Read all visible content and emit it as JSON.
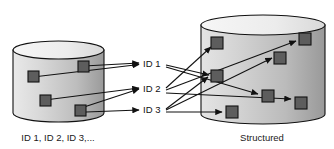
{
  "diagram": {
    "colors": {
      "outline": "#111111",
      "cylinder_fill_light": "#e6e6e6",
      "cylinder_fill_mid": "#cfcfcf",
      "cylinder_fill_dark": "#9d9d9d",
      "cylinder_top_fill": "#f2f2f2",
      "square_fill": "#5d5d5d",
      "square_border": "#111111",
      "arrow": "#111111",
      "text": "#111111",
      "background": "#ffffff"
    },
    "left_cylinder": {
      "label": "ID 1, ID 2, ID 3,...",
      "label_x": 58,
      "label_y": 140,
      "x": 13,
      "y": 41,
      "width": 91,
      "height": 81,
      "ellipse_ry": 9,
      "items": [
        {
          "name": "item-a",
          "x": 28,
          "y": 71,
          "size": 11
        },
        {
          "name": "item-b",
          "x": 78,
          "y": 61,
          "size": 11
        },
        {
          "name": "item-c",
          "x": 40,
          "y": 95,
          "size": 11
        },
        {
          "name": "item-d",
          "x": 75,
          "y": 105,
          "size": 11
        }
      ]
    },
    "right_cylinder": {
      "label": "Structured",
      "label_x": 262,
      "label_y": 140,
      "x": 201,
      "y": 15,
      "width": 124,
      "height": 109,
      "ellipse_ry": 10,
      "items": [
        {
          "name": "item-1",
          "x": 211,
          "y": 37,
          "size": 12
        },
        {
          "name": "item-2",
          "x": 299,
          "y": 33,
          "size": 12
        },
        {
          "name": "item-3",
          "x": 274,
          "y": 52,
          "size": 12
        },
        {
          "name": "item-4",
          "x": 211,
          "y": 70,
          "size": 12
        },
        {
          "name": "item-5",
          "x": 262,
          "y": 90,
          "size": 12
        },
        {
          "name": "item-6",
          "x": 295,
          "y": 97,
          "size": 12
        },
        {
          "name": "item-7",
          "x": 226,
          "y": 106,
          "size": 12
        }
      ]
    },
    "id_labels": [
      {
        "name": "id-1",
        "text": "ID 1",
        "x": 144,
        "y": 67
      },
      {
        "name": "id-2",
        "text": "ID 2",
        "x": 144,
        "y": 92
      },
      {
        "name": "id-3",
        "text": "ID 3",
        "x": 144,
        "y": 113
      }
    ],
    "arrows_in": [
      {
        "name": "arrow-item-b-to-id1",
        "x1": 84,
        "y1": 66,
        "x2": 140,
        "y2": 63
      },
      {
        "name": "arrow-item-a-to-id1",
        "x1": 33,
        "y1": 77,
        "x2": 140,
        "y2": 64
      },
      {
        "name": "arrow-item-d-to-id2",
        "x1": 81,
        "y1": 108,
        "x2": 140,
        "y2": 89
      },
      {
        "name": "arrow-item-c-to-id2",
        "x1": 45,
        "y1": 100,
        "x2": 140,
        "y2": 88
      },
      {
        "name": "arrow-item-d-to-id3",
        "x1": 86,
        "y1": 112,
        "x2": 140,
        "y2": 110
      }
    ],
    "arrows_out": [
      {
        "name": "arrow-id1-to-item4",
        "x1": 166,
        "y1": 66,
        "x2": 208,
        "y2": 76
      },
      {
        "name": "arrow-id1-to-item5",
        "x1": 166,
        "y1": 68,
        "x2": 258,
        "y2": 95
      },
      {
        "name": "arrow-id2-to-item1",
        "x1": 166,
        "y1": 88,
        "x2": 210,
        "y2": 47
      },
      {
        "name": "arrow-id2-to-item2",
        "x1": 166,
        "y1": 90,
        "x2": 296,
        "y2": 41
      },
      {
        "name": "arrow-id2-to-item6",
        "x1": 166,
        "y1": 93,
        "x2": 292,
        "y2": 99
      },
      {
        "name": "arrow-id3-to-item3",
        "x1": 166,
        "y1": 111,
        "x2": 272,
        "y2": 59
      },
      {
        "name": "arrow-id3-to-item7",
        "x1": 166,
        "y1": 113,
        "x2": 222,
        "y2": 112
      },
      {
        "name": "arrow-id3-to-item4",
        "x1": 166,
        "y1": 110,
        "x2": 208,
        "y2": 78
      }
    ]
  }
}
